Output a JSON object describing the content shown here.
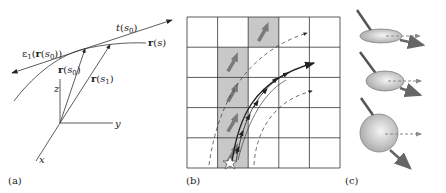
{
  "panel_a": {
    "caption": "(a)",
    "axes": {
      "x": "x",
      "y": "y",
      "z": "z"
    },
    "labels": {
      "tangent": "t(s₀)",
      "curve": "r(s)",
      "r_s0": "r(s₀)",
      "r_s1": "r(s₁)",
      "eigen": "ε₁(r(s₀))"
    }
  },
  "panel_b": {
    "caption": "(b)",
    "grid": {
      "rows": 5,
      "cols": 5
    },
    "shaded_cells": [
      [
        0,
        2
      ],
      [
        1,
        1
      ],
      [
        2,
        1
      ],
      [
        3,
        1
      ],
      [
        4,
        1
      ]
    ],
    "start_marker": "star-icon",
    "colors": {
      "shade": "#c8c8c8",
      "arrow": "#7a7a7a",
      "line": "#333333"
    }
  },
  "panel_c": {
    "caption": "(c)",
    "glyphs": [
      {
        "shape": "flat ellipsoid"
      },
      {
        "shape": "ellipsoid"
      },
      {
        "shape": "sphere"
      }
    ]
  }
}
